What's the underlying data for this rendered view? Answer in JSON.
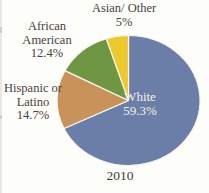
{
  "chart_data": {
    "type": "pie",
    "caption": "2010",
    "direction": "clockwise",
    "start_angle_deg": 0,
    "categories": [
      "White",
      "Hispanic or Latino",
      "African American",
      "Asian/ Other"
    ],
    "values": [
      59.3,
      14.7,
      12.4,
      5
    ],
    "slices": [
      {
        "id": "white",
        "name": "White",
        "value": 59.3,
        "pct_label": "59.3%",
        "color": "#6b7ea7",
        "label_placement": "inside"
      },
      {
        "id": "hispanic-or-latino",
        "name": "Hispanic or Latino",
        "value": 14.7,
        "pct_label": "14.7%",
        "color": "#c8935a",
        "label_placement": "outside-left"
      },
      {
        "id": "african-american",
        "name": "African American",
        "value": 12.4,
        "pct_label": "12.4%",
        "color": "#6f9743",
        "label_placement": "outside-upper-left"
      },
      {
        "id": "asian-other",
        "name": "Asian/ Other",
        "value": 5,
        "pct_label": "5%",
        "color": "#edc92c",
        "label_placement": "outside-top"
      }
    ],
    "slice_border_color": "#f7f5ef",
    "background_color": "#fdfdfa",
    "label_text_color": "#49423a",
    "inside_label_text_color": "#f3f1ea",
    "legend": "none"
  }
}
